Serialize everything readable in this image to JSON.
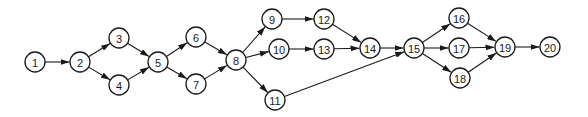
{
  "diagram": {
    "type": "directed-network",
    "colors": {
      "stroke": "#1a1a1a",
      "fill": "#ffffff"
    },
    "node_radius": 10,
    "nodes": [
      {
        "id": "1",
        "label": "1",
        "x": 35,
        "y": 62
      },
      {
        "id": "2",
        "label": "2",
        "x": 80,
        "y": 62
      },
      {
        "id": "3",
        "label": "3",
        "x": 119,
        "y": 38
      },
      {
        "id": "4",
        "label": "4",
        "x": 119,
        "y": 85
      },
      {
        "id": "5",
        "label": "5",
        "x": 158,
        "y": 62
      },
      {
        "id": "6",
        "label": "6",
        "x": 196,
        "y": 37
      },
      {
        "id": "7",
        "label": "7",
        "x": 196,
        "y": 84
      },
      {
        "id": "8",
        "label": "8",
        "x": 236,
        "y": 60
      },
      {
        "id": "9",
        "label": "9",
        "x": 272,
        "y": 19
      },
      {
        "id": "10",
        "label": "10",
        "x": 279,
        "y": 49
      },
      {
        "id": "11",
        "label": "11",
        "x": 275,
        "y": 100
      },
      {
        "id": "12",
        "label": "12",
        "x": 324,
        "y": 19
      },
      {
        "id": "13",
        "label": "13",
        "x": 324,
        "y": 49
      },
      {
        "id": "14",
        "label": "14",
        "x": 370,
        "y": 48
      },
      {
        "id": "15",
        "label": "15",
        "x": 414,
        "y": 48
      },
      {
        "id": "16",
        "label": "16",
        "x": 459,
        "y": 18
      },
      {
        "id": "17",
        "label": "17",
        "x": 459,
        "y": 48
      },
      {
        "id": "18",
        "label": "18",
        "x": 460,
        "y": 78
      },
      {
        "id": "19",
        "label": "19",
        "x": 505,
        "y": 47
      },
      {
        "id": "20",
        "label": "20",
        "x": 550,
        "y": 47
      }
    ],
    "edges": [
      {
        "from": "1",
        "to": "2"
      },
      {
        "from": "2",
        "to": "3"
      },
      {
        "from": "2",
        "to": "4"
      },
      {
        "from": "3",
        "to": "5"
      },
      {
        "from": "4",
        "to": "5"
      },
      {
        "from": "5",
        "to": "6"
      },
      {
        "from": "5",
        "to": "7"
      },
      {
        "from": "6",
        "to": "8"
      },
      {
        "from": "7",
        "to": "8"
      },
      {
        "from": "8",
        "to": "9"
      },
      {
        "from": "8",
        "to": "10"
      },
      {
        "from": "8",
        "to": "11"
      },
      {
        "from": "9",
        "to": "12"
      },
      {
        "from": "10",
        "to": "13"
      },
      {
        "from": "12",
        "to": "14"
      },
      {
        "from": "13",
        "to": "14"
      },
      {
        "from": "14",
        "to": "15"
      },
      {
        "from": "11",
        "to": "15"
      },
      {
        "from": "15",
        "to": "16"
      },
      {
        "from": "15",
        "to": "17"
      },
      {
        "from": "15",
        "to": "18"
      },
      {
        "from": "16",
        "to": "19"
      },
      {
        "from": "17",
        "to": "19"
      },
      {
        "from": "18",
        "to": "19"
      },
      {
        "from": "19",
        "to": "20"
      }
    ]
  }
}
